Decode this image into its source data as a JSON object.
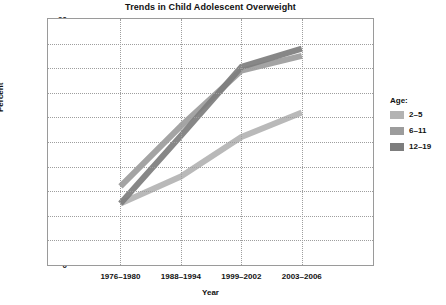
{
  "chart_data": {
    "type": "line",
    "title": "Trends in Child Adolescent Overweight",
    "xlabel": "Year",
    "ylabel": "Percent",
    "categories": [
      "1976–1980",
      "1988–1994",
      "1999–2002",
      "2003–2006"
    ],
    "ylim": [
      0,
      20
    ],
    "ytick_step": 2,
    "yticks": [
      "20",
      "18",
      "16",
      "14",
      "12",
      "10",
      "8",
      "6",
      "4",
      "2",
      "0"
    ],
    "grid": true,
    "legend_position": "right",
    "legend_title": "Age:",
    "series": [
      {
        "name": "2–5",
        "values": [
          5.0,
          7.2,
          10.4,
          12.4
        ],
        "color": "#b3b3b3"
      },
      {
        "name": "6–11",
        "values": [
          6.4,
          11.3,
          15.8,
          17.0
        ],
        "color": "#9c9c9c"
      },
      {
        "name": "12–19",
        "values": [
          5.0,
          10.5,
          16.1,
          17.6
        ],
        "color": "#7d7d7d"
      }
    ]
  },
  "colors": {
    "axis": "#9a9a9a",
    "grid": "#9e9e9e",
    "text": "#111111",
    "background": "#ffffff"
  }
}
